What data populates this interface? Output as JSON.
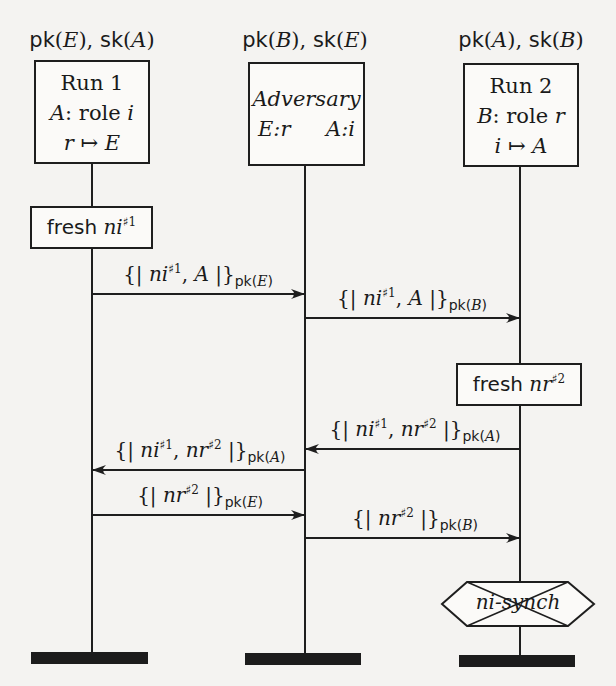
{
  "diagram": {
    "type": "message-sequence-chart",
    "roles": [
      {
        "key_label": "pk(E), sk(A)",
        "key_label_parts": {
          "pk": "pk",
          "pk_arg": "E",
          "sk": "sk",
          "sk_arg": "A"
        },
        "title": "Run 1",
        "line2_agent": "A",
        "line2_text": ": role ",
        "line2_role": "i",
        "line3_from": "r",
        "line3_arrow": "↦",
        "line3_to": "E"
      },
      {
        "key_label": "pk(B), sk(E)",
        "key_label_parts": {
          "pk": "pk",
          "pk_arg": "B",
          "sk": "sk",
          "sk_arg": "E"
        },
        "title": "Adversary",
        "left": "E:r",
        "right": "A:i"
      },
      {
        "key_label": "pk(A), sk(B)",
        "key_label_parts": {
          "pk": "pk",
          "pk_arg": "A",
          "sk": "sk",
          "sk_arg": "B"
        },
        "title": "Run 2",
        "line2_agent": "B",
        "line2_text": ": role ",
        "line2_role": "r",
        "line3_from": "i",
        "line3_arrow": "↦",
        "line3_to": "A"
      }
    ],
    "events": [
      {
        "kind": "fresh",
        "lifeline": 0,
        "keyword": "fresh",
        "var": "ni",
        "sup": "♯1"
      },
      {
        "kind": "fresh",
        "lifeline": 2,
        "keyword": "fresh",
        "var": "nr",
        "sup": "♯2"
      }
    ],
    "messages": [
      {
        "from": 0,
        "to": 1,
        "open": "{|",
        "content": [
          {
            "v": "ni",
            "s": "♯1"
          },
          {
            "v": "A"
          }
        ],
        "close": "|}",
        "key_fn": "pk",
        "key_arg": "E"
      },
      {
        "from": 1,
        "to": 2,
        "open": "{|",
        "content": [
          {
            "v": "ni",
            "s": "♯1"
          },
          {
            "v": "A"
          }
        ],
        "close": "|}",
        "key_fn": "pk",
        "key_arg": "B"
      },
      {
        "from": 2,
        "to": 1,
        "open": "{|",
        "content": [
          {
            "v": "ni",
            "s": "♯1"
          },
          {
            "v": "nr",
            "s": "♯2"
          }
        ],
        "close": "|}",
        "key_fn": "pk",
        "key_arg": "A"
      },
      {
        "from": 1,
        "to": 0,
        "open": "{|",
        "content": [
          {
            "v": "ni",
            "s": "♯1"
          },
          {
            "v": "nr",
            "s": "♯2"
          }
        ],
        "close": "|}",
        "key_fn": "pk",
        "key_arg": "A"
      },
      {
        "from": 0,
        "to": 1,
        "open": "{|",
        "content": [
          {
            "v": "nr",
            "s": "♯2"
          }
        ],
        "close": "|}",
        "key_fn": "pk",
        "key_arg": "E"
      },
      {
        "from": 1,
        "to": 2,
        "open": "{|",
        "content": [
          {
            "v": "nr",
            "s": "♯2"
          }
        ],
        "close": "|}",
        "key_fn": "pk",
        "key_arg": "B"
      }
    ],
    "claim": {
      "lifeline": 2,
      "label": "ni-synch",
      "status": "violated (crossed out)"
    },
    "colors": {
      "ink": "#1e1e1e",
      "paper": "#f4f3f1"
    }
  }
}
